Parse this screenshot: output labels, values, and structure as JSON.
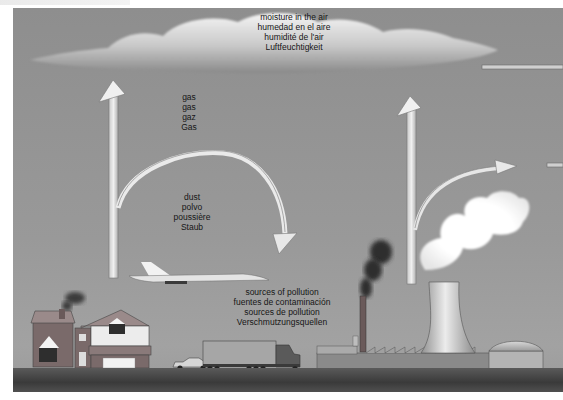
{
  "header": {
    "caption": ""
  },
  "diagram": {
    "labels": {
      "moisture": [
        "moisture in the air",
        "humedad en el aire",
        "humidité de l'air",
        "Luftfeuchtigkeit"
      ],
      "gas": [
        "gas",
        "gas",
        "gaz",
        "Gas"
      ],
      "dust": [
        "dust",
        "polvo",
        "poussière",
        "Staub"
      ],
      "sources": [
        "sources of pollution",
        "fuentes de contaminación",
        "sources de pollution",
        "Verschmutzungsquellen"
      ]
    },
    "elements": [
      "cloud",
      "house",
      "car",
      "truck",
      "supersonic-airplane",
      "factory",
      "chimney-smoke",
      "cooling-tower",
      "steam-plume",
      "storage-dome",
      "arrows"
    ],
    "colors": {
      "background": "#969696",
      "ground": "#444444",
      "smoke": "#2e2e2e",
      "steam": "#ffffff",
      "text": "#161616"
    }
  }
}
